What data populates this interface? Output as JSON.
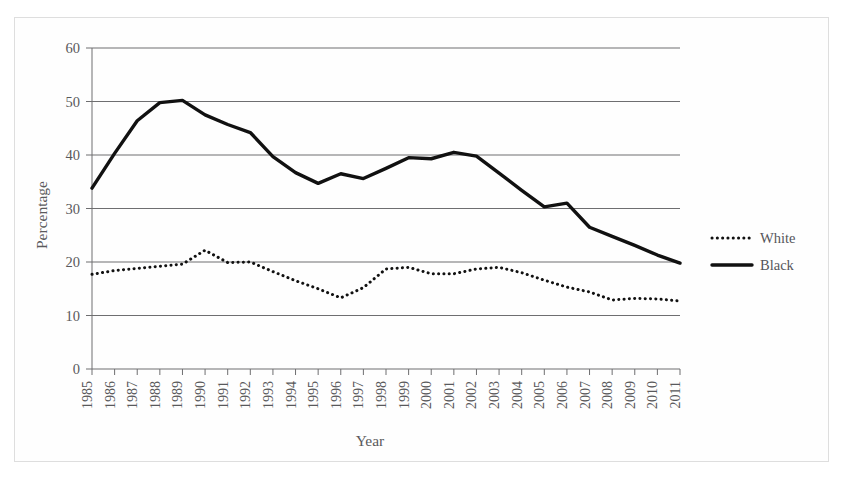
{
  "figure": {
    "background_color": "#ffffff",
    "frame_color": "#dedede"
  },
  "chart_data": {
    "type": "line",
    "title": "",
    "xlabel": "Year",
    "ylabel": "Percentage",
    "xlim": [
      1985,
      2011
    ],
    "ylim": [
      0,
      60
    ],
    "yticks": [
      0,
      10,
      20,
      30,
      40,
      50,
      60
    ],
    "grid": "horizontal",
    "legend_position": "right",
    "categories": [
      "1985",
      "1986",
      "1987",
      "1988",
      "1989",
      "1990",
      "1991",
      "1992",
      "1993",
      "1994",
      "1995",
      "1996",
      "1997",
      "1998",
      "1999",
      "2000",
      "2001",
      "2002",
      "2003",
      "2004",
      "2005",
      "2006",
      "2007",
      "2008",
      "2009",
      "2010",
      "2011"
    ],
    "series": [
      {
        "name": "White",
        "style": "dotted",
        "color": "#111111",
        "values": [
          17.7,
          18.4,
          18.8,
          19.2,
          19.6,
          22.2,
          19.9,
          20.0,
          18.2,
          16.5,
          15.0,
          13.3,
          15.2,
          18.7,
          19.0,
          17.8,
          17.8,
          18.7,
          19.0,
          18.0,
          16.6,
          15.3,
          14.4,
          12.9,
          13.2,
          13.1,
          12.7
        ]
      },
      {
        "name": "Black",
        "style": "solid",
        "color": "#111111",
        "values": [
          33.8,
          40.3,
          46.4,
          49.8,
          50.2,
          47.5,
          45.7,
          44.2,
          39.7,
          36.7,
          34.7,
          36.5,
          35.6,
          37.5,
          39.5,
          39.3,
          40.5,
          39.8,
          36.6,
          33.4,
          30.3,
          31.0,
          26.5,
          24.8,
          23.1,
          21.3,
          19.8
        ]
      }
    ],
    "annotations": []
  },
  "legend": {
    "entries": [
      {
        "label": "White",
        "style": "dotted"
      },
      {
        "label": "Black",
        "style": "solid"
      }
    ]
  },
  "axes": {
    "y_title": "Percentage",
    "x_title": "Year"
  }
}
